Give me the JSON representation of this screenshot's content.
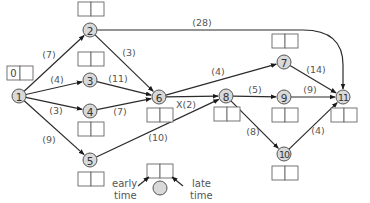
{
  "diagram": {
    "type": "activity-network",
    "nodes": [
      {
        "id": "1",
        "label": "1",
        "x": 19,
        "y": 96,
        "box": {
          "x": 7,
          "y": 66,
          "early": "0",
          "late": ""
        }
      },
      {
        "id": "2",
        "label": "2",
        "x": 90,
        "y": 30,
        "box": {
          "x": 78,
          "y": 2,
          "early": "",
          "late": ""
        }
      },
      {
        "id": "3",
        "label": "3",
        "x": 90,
        "y": 80,
        "box": {
          "x": 78,
          "y": 52,
          "early": "",
          "late": ""
        }
      },
      {
        "id": "4",
        "label": "4",
        "x": 90,
        "y": 111,
        "box": {
          "x": 78,
          "y": 122,
          "early": "",
          "late": ""
        }
      },
      {
        "id": "5",
        "label": "5",
        "x": 90,
        "y": 160,
        "box": {
          "x": 78,
          "y": 172,
          "early": "",
          "late": ""
        }
      },
      {
        "id": "6",
        "label": "6",
        "x": 159,
        "y": 97,
        "box": {
          "x": 147,
          "y": 108,
          "early": "",
          "late": ""
        }
      },
      {
        "id": "7",
        "label": "7",
        "x": 284,
        "y": 62,
        "box": {
          "x": 272,
          "y": 34,
          "early": "",
          "late": ""
        }
      },
      {
        "id": "8",
        "label": "8",
        "x": 226,
        "y": 96,
        "box": {
          "x": 214,
          "y": 107,
          "early": "",
          "late": ""
        }
      },
      {
        "id": "9",
        "label": "9",
        "x": 284,
        "y": 97,
        "box": {
          "x": 272,
          "y": 108,
          "early": "",
          "late": ""
        }
      },
      {
        "id": "10",
        "label": "10",
        "x": 284,
        "y": 154,
        "box": {
          "x": 272,
          "y": 166,
          "early": "",
          "late": ""
        }
      },
      {
        "id": "11",
        "label": "11",
        "x": 343,
        "y": 97,
        "box": {
          "x": 331,
          "y": 108,
          "early": "",
          "late": ""
        }
      }
    ],
    "edges": [
      {
        "from": "1",
        "to": "2",
        "label": "(7)",
        "lx": 49,
        "ly": 58
      },
      {
        "from": "1",
        "to": "3",
        "label": "(4)",
        "lx": 57,
        "ly": 83
      },
      {
        "from": "1",
        "to": "4",
        "label": "(3)",
        "lx": 56,
        "ly": 114
      },
      {
        "from": "1",
        "to": "5",
        "label": "(9)",
        "lx": 49,
        "ly": 143
      },
      {
        "from": "2",
        "to": "6",
        "label": "(3)",
        "lx": 129,
        "ly": 56
      },
      {
        "from": "2",
        "to": "11",
        "label": "(28)",
        "lx": 202,
        "ly": 26,
        "curved": true
      },
      {
        "from": "3",
        "to": "6",
        "label": "(11)",
        "lx": 118,
        "ly": 82
      },
      {
        "from": "4",
        "to": "6",
        "label": "(7)",
        "lx": 120,
        "ly": 115
      },
      {
        "from": "5",
        "to": "8",
        "label": "(10)",
        "lx": 158,
        "ly": 141
      },
      {
        "from": "6",
        "to": "7",
        "label": "(4)",
        "lx": 218,
        "ly": 75
      },
      {
        "from": "6",
        "to": "8",
        "label": "X(2)",
        "lx": 186,
        "ly": 108
      },
      {
        "from": "7",
        "to": "11",
        "label": "(14)",
        "lx": 316,
        "ly": 73
      },
      {
        "from": "8",
        "to": "9",
        "label": "(5)",
        "lx": 255,
        "ly": 93
      },
      {
        "from": "8",
        "to": "10",
        "label": "(8)",
        "lx": 253,
        "ly": 135
      },
      {
        "from": "9",
        "to": "11",
        "label": "(9)",
        "lx": 310,
        "ly": 93
      },
      {
        "from": "10",
        "to": "11",
        "label": "(4)",
        "lx": 318,
        "ly": 134
      }
    ],
    "legend": {
      "early_label_line1": "early",
      "early_label_line2": "time",
      "late_label_line1": "late",
      "late_label_line2": "time"
    }
  },
  "colors": {
    "node_fill": "#d9d9d9",
    "edge": "#2b2b2b",
    "label": "#555555"
  }
}
